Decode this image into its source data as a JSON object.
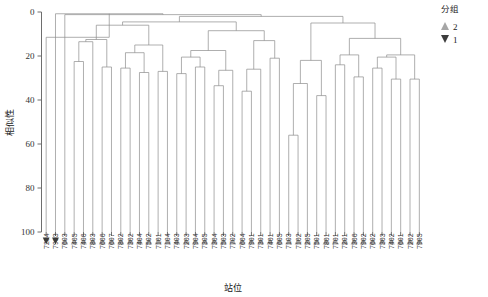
{
  "chart_data": {
    "type": "dendrogram",
    "title": "",
    "xlabel": "站位",
    "ylabel": "相似性",
    "ylim": [
      0,
      100
    ],
    "y_inverted": true,
    "yticks": [
      0,
      20,
      40,
      60,
      80,
      100
    ],
    "ytick_labels": [
      "0",
      "20",
      "40",
      "60",
      "80",
      "100"
    ],
    "grid": false,
    "legend": {
      "title": "分组",
      "position": "top-right",
      "entries": [
        {
          "label": "2",
          "marker": "triangle-up",
          "color": "#a6a6a6"
        },
        {
          "label": "1",
          "marker": "triangle-down",
          "color": "#3d3d3d"
        }
      ]
    },
    "leaves": [
      {
        "label": "7204",
        "group": "1"
      },
      {
        "label": "7903",
        "group": "1"
      },
      {
        "label": "7603",
        "group": "2"
      },
      {
        "label": "7405",
        "group": "2"
      },
      {
        "label": "7406",
        "group": "2"
      },
      {
        "label": "7803",
        "group": "2"
      },
      {
        "label": "7606",
        "group": "2"
      },
      {
        "label": "7607",
        "group": "2"
      },
      {
        "label": "7802",
        "group": "2"
      },
      {
        "label": "7302",
        "group": "2"
      },
      {
        "label": "7404",
        "group": "2"
      },
      {
        "label": "7502",
        "group": "2"
      },
      {
        "label": "7101",
        "group": "2"
      },
      {
        "label": "7104",
        "group": "2"
      },
      {
        "label": "7403",
        "group": "2"
      },
      {
        "label": "7203",
        "group": "2"
      },
      {
        "label": "7904",
        "group": "2"
      },
      {
        "label": "7305",
        "group": "2"
      },
      {
        "label": "7304",
        "group": "2"
      },
      {
        "label": "7503",
        "group": "2"
      },
      {
        "label": "7702",
        "group": "2"
      },
      {
        "label": "7604",
        "group": "2"
      },
      {
        "label": "7901",
        "group": "2"
      },
      {
        "label": "7301",
        "group": "2"
      },
      {
        "label": "7401",
        "group": "2"
      },
      {
        "label": "7605",
        "group": "2"
      },
      {
        "label": "7103",
        "group": "2"
      },
      {
        "label": "7102",
        "group": "2"
      },
      {
        "label": "7205",
        "group": "2"
      },
      {
        "label": "7501",
        "group": "2"
      },
      {
        "label": "7801",
        "group": "2"
      },
      {
        "label": "7701",
        "group": "2"
      },
      {
        "label": "7201",
        "group": "2"
      },
      {
        "label": "7306",
        "group": "2"
      },
      {
        "label": "7902",
        "group": "2"
      },
      {
        "label": "7602",
        "group": "2"
      },
      {
        "label": "7303",
        "group": "2"
      },
      {
        "label": "7402",
        "group": "2"
      },
      {
        "label": "7601",
        "group": "2"
      },
      {
        "label": "7202",
        "group": "2"
      },
      {
        "label": "7905",
        "group": "2"
      }
    ],
    "merges": [
      {
        "id": "m1",
        "left": {
          "leaf": 3
        },
        "right": {
          "leaf": 4
        },
        "height": 22.5
      },
      {
        "id": "m2",
        "left": {
          "leaf": 5
        },
        "right": {
          "node": "m1"
        },
        "height": 13.5
      },
      {
        "id": "m3",
        "left": {
          "leaf": 6
        },
        "right": {
          "leaf": 7
        },
        "height": 25.0
      },
      {
        "id": "m4",
        "left": {
          "node": "m2"
        },
        "right": {
          "node": "m3"
        },
        "height": 12.5
      },
      {
        "id": "m5",
        "left": {
          "leaf": 8
        },
        "right": {
          "leaf": 9
        },
        "height": 25.5
      },
      {
        "id": "m6",
        "left": {
          "leaf": 10
        },
        "right": {
          "leaf": 11
        },
        "height": 27.5
      },
      {
        "id": "m7",
        "left": {
          "node": "m5"
        },
        "right": {
          "node": "m6"
        },
        "height": 18.5
      },
      {
        "id": "m8",
        "left": {
          "leaf": 12
        },
        "right": {
          "leaf": 13
        },
        "height": 27.0
      },
      {
        "id": "m9",
        "left": {
          "node": "m7"
        },
        "right": {
          "node": "m8"
        },
        "height": 15.0
      },
      {
        "id": "m10",
        "left": {
          "node": "m4"
        },
        "right": {
          "node": "m9"
        },
        "height": 6.0
      },
      {
        "id": "m11",
        "left": {
          "leaf": 14
        },
        "right": {
          "leaf": 15
        },
        "height": 28.0
      },
      {
        "id": "m12",
        "left": {
          "leaf": 16
        },
        "right": {
          "leaf": 17
        },
        "height": 25.0
      },
      {
        "id": "m13",
        "left": {
          "node": "m11"
        },
        "right": {
          "node": "m12"
        },
        "height": 20.5
      },
      {
        "id": "m14",
        "left": {
          "leaf": 18
        },
        "right": {
          "leaf": 19
        },
        "height": 33.5
      },
      {
        "id": "m15",
        "left": {
          "node": "m14"
        },
        "right": {
          "leaf": 20
        },
        "height": 26.5
      },
      {
        "id": "m16",
        "left": {
          "node": "m13"
        },
        "right": {
          "node": "m15"
        },
        "height": 17.5
      },
      {
        "id": "m17",
        "left": {
          "leaf": 21
        },
        "right": {
          "leaf": 22
        },
        "height": 36.0
      },
      {
        "id": "m18",
        "left": {
          "node": "m17"
        },
        "right": {
          "leaf": 23
        },
        "height": 26.0
      },
      {
        "id": "m19",
        "left": {
          "leaf": 24
        },
        "right": {
          "leaf": 25
        },
        "height": 21.0
      },
      {
        "id": "m20",
        "left": {
          "node": "m19"
        },
        "right": {
          "node": "m18"
        },
        "height": 13.0
      },
      {
        "id": "m21",
        "left": {
          "node": "m16"
        },
        "right": {
          "node": "m20"
        },
        "height": 8.5
      },
      {
        "id": "m22",
        "left": {
          "node": "m10"
        },
        "right": {
          "node": "m21"
        },
        "height": 4.5
      },
      {
        "id": "m23",
        "left": {
          "leaf": 26
        },
        "right": {
          "leaf": 27
        },
        "height": 56.0
      },
      {
        "id": "m24",
        "left": {
          "node": "m23"
        },
        "right": {
          "leaf": 28
        },
        "height": 32.5
      },
      {
        "id": "m25",
        "left": {
          "leaf": 29
        },
        "right": {
          "leaf": 30
        },
        "height": 38.0
      },
      {
        "id": "m26",
        "left": {
          "node": "m24"
        },
        "right": {
          "node": "m25"
        },
        "height": 22.0
      },
      {
        "id": "m27",
        "left": {
          "leaf": 31
        },
        "right": {
          "leaf": 32
        },
        "height": 24.0
      },
      {
        "id": "m28",
        "left": {
          "leaf": 33
        },
        "right": {
          "leaf": 34
        },
        "height": 29.5
      },
      {
        "id": "m29",
        "left": {
          "node": "m27"
        },
        "right": {
          "node": "m28"
        },
        "height": 19.5
      },
      {
        "id": "m30",
        "left": {
          "leaf": 35
        },
        "right": {
          "leaf": 36
        },
        "height": 25.5
      },
      {
        "id": "m31",
        "left": {
          "leaf": 37
        },
        "right": {
          "leaf": 38
        },
        "height": 30.5
      },
      {
        "id": "m32",
        "left": {
          "node": "m30"
        },
        "right": {
          "node": "m31"
        },
        "height": 20.5
      },
      {
        "id": "m33",
        "left": {
          "leaf": 39
        },
        "right": {
          "leaf": 40
        },
        "height": 30.5
      },
      {
        "id": "m34",
        "left": {
          "node": "m32"
        },
        "right": {
          "node": "m33"
        },
        "height": 19.5
      },
      {
        "id": "m35",
        "left": {
          "node": "m29"
        },
        "right": {
          "node": "m34"
        },
        "height": 12.0
      },
      {
        "id": "m36",
        "left": {
          "node": "m26"
        },
        "right": {
          "node": "m35"
        },
        "height": 5.0
      },
      {
        "id": "m37",
        "left": {
          "node": "m22"
        },
        "right": {
          "node": "m36"
        },
        "height": 2.0
      },
      {
        "id": "m38",
        "left": {
          "leaf": 2
        },
        "right": {
          "node": "m37"
        },
        "height": 1.2
      },
      {
        "id": "m39",
        "left": {
          "leaf": 1
        },
        "right": {
          "node": "m38"
        },
        "height": 0.8
      },
      {
        "id": "m40",
        "left": {
          "leaf": 0
        },
        "right": {
          "node": "m39"
        },
        "height": 11.5
      }
    ]
  }
}
